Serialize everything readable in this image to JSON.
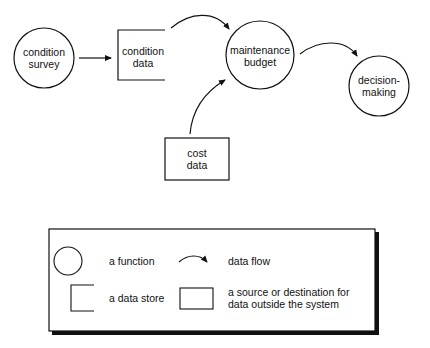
{
  "diagram": {
    "type": "data-flow-diagram",
    "nodes": [
      {
        "id": "condition_survey",
        "shape": "circle",
        "label_line1": "condition",
        "label_line2": "survey"
      },
      {
        "id": "condition_data",
        "shape": "data-store",
        "label_line1": "condition",
        "label_line2": "data"
      },
      {
        "id": "maintenance_budget",
        "shape": "circle",
        "label_line1": "maintenance",
        "label_line2": "budget"
      },
      {
        "id": "decision_making",
        "shape": "circle",
        "label_line1": "decision-",
        "label_line2": "making"
      },
      {
        "id": "cost_data",
        "shape": "rectangle",
        "label_line1": "cost",
        "label_line2": "data"
      }
    ],
    "edges": [
      {
        "from": "condition_survey",
        "to": "condition_data",
        "style": "straight-arrow"
      },
      {
        "from": "condition_data",
        "to": "maintenance_budget",
        "style": "curved-arrow"
      },
      {
        "from": "cost_data",
        "to": "maintenance_budget",
        "style": "curved-arrow"
      },
      {
        "from": "maintenance_budget",
        "to": "decision_making",
        "style": "curved-arrow"
      }
    ]
  },
  "legend": {
    "items": [
      {
        "symbol": "circle",
        "label": "a function"
      },
      {
        "symbol": "curved-arrow",
        "label": "data flow"
      },
      {
        "symbol": "data-store",
        "label": "a data store"
      },
      {
        "symbol": "rectangle",
        "label_line1": "a source or destination for",
        "label_line2": "data outside the system"
      }
    ]
  }
}
